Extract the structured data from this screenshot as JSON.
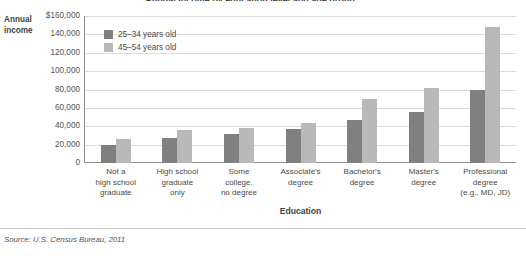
{
  "chart_data": {
    "type": "bar",
    "title": "Annual income by education level and age group",
    "xlabel": "Education",
    "ylabel": "Annual income",
    "ylim": [
      0,
      160000
    ],
    "ytick_values": [
      160000,
      140000,
      120000,
      100000,
      80000,
      60000,
      40000,
      20000,
      0
    ],
    "ytick_labels": [
      "$160,000",
      "140,000",
      "120,000",
      "100,000",
      "80,000",
      "60,000",
      "40,000",
      "20,000",
      "0"
    ],
    "grid": true,
    "legend_position": "top-left-inside",
    "categories": [
      "Not a\nhigh school\ngraduate",
      "High school\ngraduate\nonly",
      "Some\ncollege,\nno degree",
      "Associate's\ndegree",
      "Bachelor's\ndegree",
      "Master's\ndegree",
      "Professional\ndegree\n(e.g., MD, JD)"
    ],
    "series": [
      {
        "name": "25–34 years old",
        "color": "#808080",
        "values": [
          20000,
          27000,
          32000,
          37000,
          47000,
          56000,
          80000
        ]
      },
      {
        "name": "45–54 years old",
        "color": "#b9b9b9",
        "values": [
          26000,
          36000,
          38000,
          44000,
          70000,
          82000,
          148000
        ]
      }
    ],
    "annotations": {
      "source": "Source: U.S. Census Bureau, 2011"
    }
  },
  "axes": {
    "y_title_line1": "Annual",
    "y_title_line2": "income",
    "x_title": "Education"
  },
  "categories_display": [
    [
      "Not a",
      "high school",
      "graduate"
    ],
    [
      "High school",
      "graduate",
      "only"
    ],
    [
      "Some",
      "college,",
      "no degree"
    ],
    [
      "Associate's",
      "degree"
    ],
    [
      "Bachelor's",
      "degree"
    ],
    [
      "Master's",
      "degree"
    ],
    [
      "Professional",
      "degree",
      "(e.g., MD, JD)"
    ]
  ],
  "legend": {
    "items": [
      {
        "label": "25–34 years old",
        "color": "#808080"
      },
      {
        "label": "45–54 years old",
        "color": "#b9b9b9"
      }
    ]
  },
  "footer": {
    "source": "Source: U.S. Census Bureau, 2011"
  },
  "colors": {
    "series_a": "#808080",
    "series_b": "#b9b9b9",
    "axis": "#8e8e8e",
    "grid": "#dcdcdc",
    "text": "#4a4a4a",
    "background": "#ffffff"
  }
}
